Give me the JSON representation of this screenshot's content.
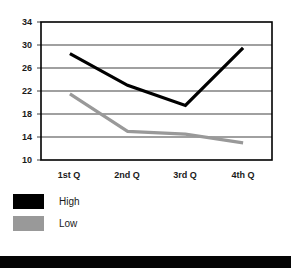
{
  "chart_data": {
    "type": "line",
    "title": "",
    "subtitle": "",
    "xlabel": "",
    "ylabel": "",
    "categories": [
      "1st Q",
      "2nd Q",
      "3rd Q",
      "4th Q"
    ],
    "yticks": [
      34,
      30,
      26,
      22,
      18,
      14,
      10
    ],
    "ylim": [
      10,
      34
    ],
    "grid": true,
    "grid_axis": "y",
    "legend_position": "below-left",
    "series": [
      {
        "name": "High",
        "color": "#000000",
        "values": [
          28.5,
          23.0,
          19.5,
          29.5
        ]
      },
      {
        "name": "Low",
        "color": "#999999",
        "values": [
          21.5,
          15.0,
          14.5,
          13.0
        ]
      }
    ]
  },
  "axes": {
    "y_tick_0": "34",
    "y_tick_1": "30",
    "y_tick_2": "26",
    "y_tick_3": "22",
    "y_tick_4": "18",
    "y_tick_5": "14",
    "y_tick_6": "10",
    "x_tick_0": "1st Q",
    "x_tick_1": "2nd Q",
    "x_tick_2": "3rd Q",
    "x_tick_3": "4th Q"
  },
  "legend": {
    "items": [
      {
        "label": "High",
        "color": "#000000"
      },
      {
        "label": "Low",
        "color": "#999999"
      }
    ]
  },
  "colors": {
    "high_series": "#000000",
    "low_series": "#999999",
    "grid": "#808080",
    "frame": "#000000",
    "footer_bar": "#000000",
    "background": "#ffffff"
  },
  "footer": {
    "bar_present": true
  }
}
